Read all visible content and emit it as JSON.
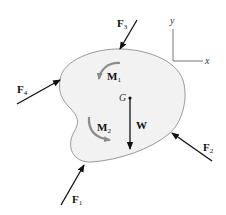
{
  "diagram": {
    "colors": {
      "body_fill": "#f2f2f2",
      "body_stroke": "#9a9a9a",
      "force_arrow": "#111111",
      "moment_arrow": "#8c8c8c",
      "axis": "#777777"
    },
    "axes": {
      "x_label": "x",
      "y_label": "y"
    },
    "center_of_gravity": {
      "label": "G"
    },
    "weight": {
      "label": "W"
    },
    "forces": [
      {
        "id": "F1",
        "letter": "F",
        "sub": "1"
      },
      {
        "id": "F2",
        "letter": "F",
        "sub": "2"
      },
      {
        "id": "F3",
        "letter": "F",
        "sub": "3"
      },
      {
        "id": "F4",
        "letter": "F",
        "sub": "4"
      }
    ],
    "moments": [
      {
        "id": "M1",
        "letter": "M",
        "sub": "1",
        "direction": "counterclockwise"
      },
      {
        "id": "M2",
        "letter": "M",
        "sub": "2",
        "direction": "counterclockwise"
      }
    ]
  }
}
